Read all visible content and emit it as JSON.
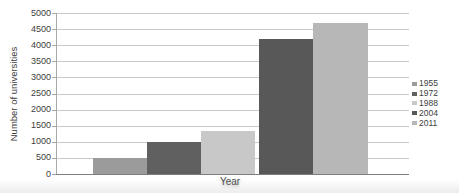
{
  "chart_data": {
    "type": "bar",
    "title": "",
    "xlabel": "Year",
    "ylabel": "Number of universities",
    "ylim": [
      0,
      5000
    ],
    "yticks": [
      0,
      500,
      1000,
      1500,
      2000,
      2500,
      3000,
      3500,
      4000,
      4500,
      5000
    ],
    "grid": true,
    "legend_position": "right",
    "categories": [
      "Year"
    ],
    "series": [
      {
        "name": "1955",
        "values": [
          500
        ],
        "color": "#9b9b9b"
      },
      {
        "name": "1972",
        "values": [
          1000
        ],
        "color": "#606060"
      },
      {
        "name": "1988",
        "values": [
          1350
        ],
        "color": "#c8c8c8"
      },
      {
        "name": "2004",
        "values": [
          4200
        ],
        "color": "#585858"
      },
      {
        "name": "2011",
        "values": [
          4700
        ],
        "color": "#b7b7b7"
      }
    ]
  },
  "styles": {
    "gridline_color": "#c9c9c9",
    "axis_color": "#8f8f8f",
    "text_color": "#3d3d3d",
    "background": "#ffffff"
  }
}
